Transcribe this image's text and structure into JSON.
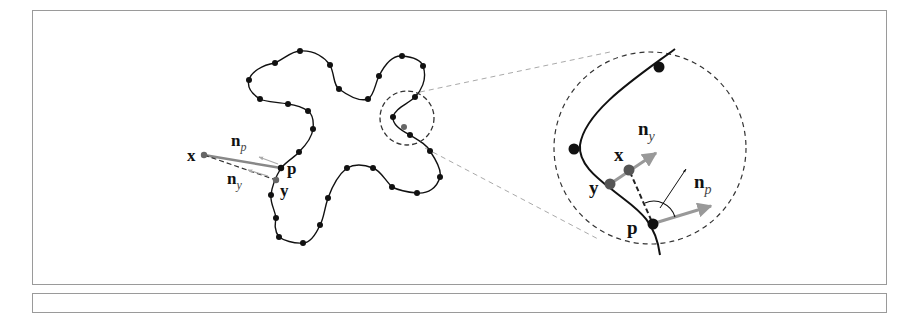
{
  "figure": {
    "left_panel": {
      "labels": {
        "x": "x",
        "p": "p",
        "y": "y",
        "n": "n",
        "n_p_sub": "p",
        "n_y_sub": "y"
      },
      "sample_points": [
        [
          300,
          51
        ],
        [
          330,
          65
        ],
        [
          339,
          89
        ],
        [
          368,
          99
        ],
        [
          379,
          76
        ],
        [
          402,
          56
        ],
        [
          423,
          66
        ],
        [
          415,
          97
        ],
        [
          393,
          117
        ],
        [
          410,
          135
        ],
        [
          430,
          151
        ],
        [
          440,
          177
        ],
        [
          417,
          193
        ],
        [
          392,
          187
        ],
        [
          373,
          168
        ],
        [
          347,
          168
        ],
        [
          328,
          198
        ],
        [
          320,
          225
        ],
        [
          303,
          243
        ],
        [
          279,
          237
        ],
        [
          276,
          218
        ],
        [
          271,
          195
        ],
        [
          299,
          152
        ],
        [
          313,
          129
        ],
        [
          308,
          111
        ],
        [
          288,
          104
        ],
        [
          260,
          99
        ],
        [
          249,
          80
        ],
        [
          275,
          63
        ]
      ],
      "point_p": [
        281,
        168
      ],
      "point_y": [
        276,
        180
      ],
      "point_x": [
        204,
        155
      ],
      "zoom_region_center": [
        402,
        118
      ],
      "zoom_region_radius": 27
    },
    "right_panel": {
      "labels": {
        "x": "x",
        "p": "p",
        "y": "y",
        "n": "n",
        "n_y_sub": "y",
        "n_p_sub": "p"
      },
      "circle_center": [
        643,
        148
      ],
      "circle_radius": 96
    },
    "colors": {
      "curve": "#111111",
      "sample_point": "#111111",
      "highlight_point": "#666666",
      "normal_arrow": "#999999",
      "dashed": "#444444",
      "connector_dashed": "#aaaaaa",
      "frame": "#9a9a9a"
    }
  }
}
